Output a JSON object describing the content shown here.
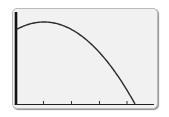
{
  "chart_data": {
    "type": "line",
    "title": "",
    "xlabel": "",
    "ylabel": "",
    "x_ticks": [
      1,
      2,
      3,
      4
    ],
    "xlim": [
      0,
      4.3
    ],
    "ylim": [
      0,
      1.0
    ],
    "grid": false,
    "series": [
      {
        "name": "curve",
        "x": [
          0,
          0.5,
          1.0,
          1.5,
          2.0,
          2.5,
          3.0,
          3.5,
          4.0,
          4.3
        ],
        "y": [
          0.88,
          0.95,
          0.96,
          0.91,
          0.8,
          0.64,
          0.44,
          0.2,
          -0.02,
          -0.02
        ]
      }
    ]
  },
  "colors": {
    "screen_bg": "#f1f1f1",
    "curve": "#2a2a2a",
    "axis": "#111111"
  }
}
